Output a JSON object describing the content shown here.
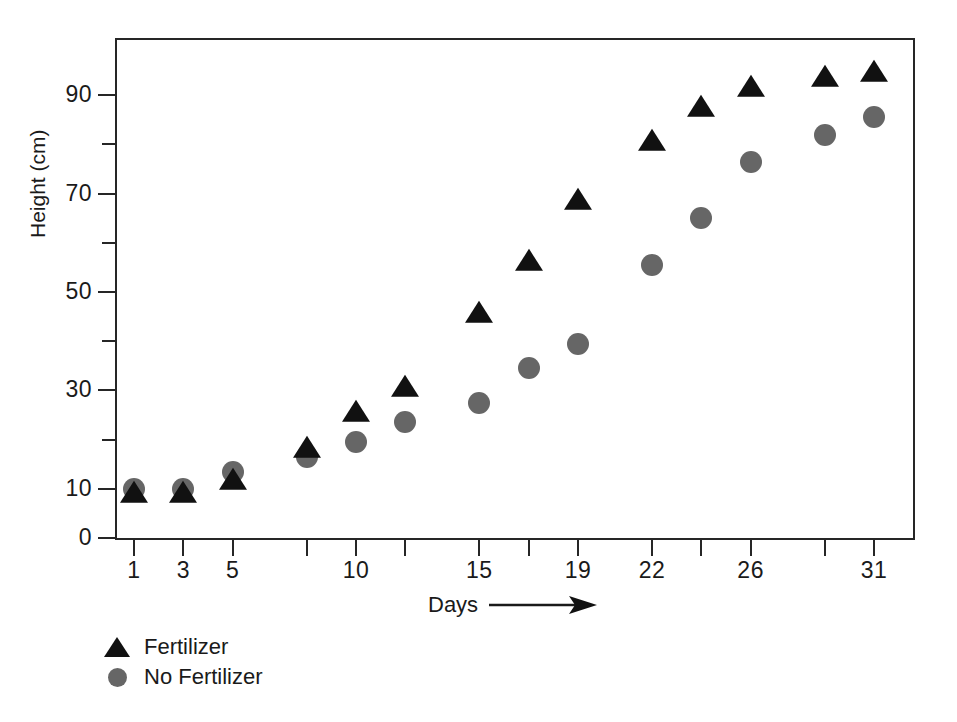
{
  "chart_data": {
    "type": "scatter",
    "title": "",
    "xlabel": "Days",
    "xlabel_arrow": "→",
    "ylabel": "Height (cm)",
    "xlim": [
      0,
      32.8
    ],
    "ylim": [
      0,
      100
    ],
    "grid": false,
    "legend_position": "below-left",
    "x": [
      1,
      3,
      5,
      8,
      10,
      12,
      15,
      17,
      19,
      22,
      24,
      26,
      29,
      31
    ],
    "x_tick_values": [
      1,
      3,
      5,
      8,
      10,
      12,
      15,
      17,
      19,
      22,
      24,
      26,
      29,
      31
    ],
    "x_tick_labels": [
      "1",
      "3",
      "5",
      "",
      "10",
      "",
      "15",
      "",
      "19",
      "22",
      "",
      "26",
      "",
      "31"
    ],
    "y_tick_major_values": [
      0,
      10,
      30,
      50,
      70,
      90
    ],
    "y_tick_major_labels": [
      "0",
      "10",
      "30",
      "50",
      "70",
      "90"
    ],
    "y_tick_minor_values": [
      20,
      40,
      60,
      80
    ],
    "series": [
      {
        "name": "Fertilizer",
        "marker": "triangle",
        "color": "#111111",
        "values": [
          9,
          9,
          11.5,
          18,
          25.5,
          30.5,
          45.5,
          56,
          68.5,
          80.5,
          87.5,
          91.5,
          93.5,
          94.5
        ]
      },
      {
        "name": "No Fertilizer",
        "marker": "circle",
        "color": "#666666",
        "values": [
          10,
          10,
          13.5,
          16.5,
          19.5,
          23.5,
          27.5,
          34.5,
          39.5,
          55.5,
          65,
          76.5,
          82,
          85.5
        ]
      }
    ]
  },
  "legend": {
    "items": [
      {
        "label": "Fertilizer",
        "marker": "triangle"
      },
      {
        "label": "No Fertilizer",
        "marker": "circle"
      }
    ]
  },
  "axes": {
    "y_title": "Height (cm)",
    "x_title": "Days"
  }
}
